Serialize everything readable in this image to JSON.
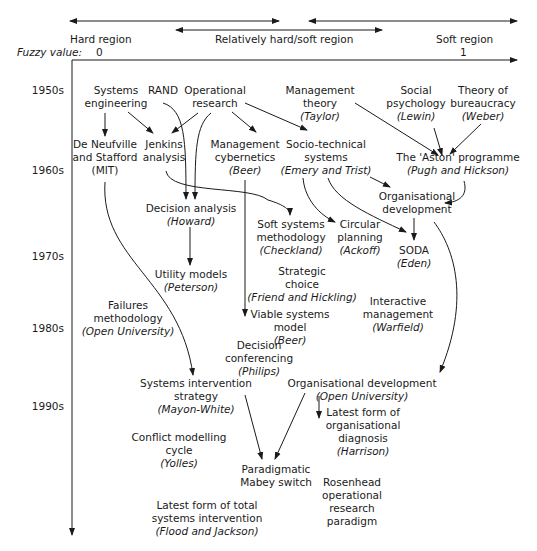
{
  "header": {
    "hard_region": "Hard region",
    "relative_region": "Relatively hard/soft region",
    "soft_region": "Soft region",
    "fuzzy_label": "Fuzzy value:",
    "fuzzy_min": "0",
    "fuzzy_max": "1"
  },
  "decades": [
    "1950s",
    "1960s",
    "1970s",
    "1980s",
    "1990s"
  ],
  "nodes": {
    "systems_engineering": {
      "l1": "Systems",
      "l2": "engineering"
    },
    "rand": {
      "l1": "RAND"
    },
    "operational_research": {
      "l1": "Operational",
      "l2": "research"
    },
    "management_theory": {
      "l1": "Management",
      "l2": "theory",
      "author": "(Taylor)"
    },
    "social_psychology": {
      "l1": "Social",
      "l2": "psychology",
      "author": "(Lewin)"
    },
    "theory_bureaucracy": {
      "l1": "Theory of",
      "l2": "bureaucracy",
      "author": "(Weber)"
    },
    "de_neufville": {
      "l1": "De Neufville",
      "l2": "and Stafford",
      "l3": "(MIT)"
    },
    "jenkins": {
      "l1": "Jenkins",
      "l2": "analysis"
    },
    "mgmt_cybernetics": {
      "l1": "Management",
      "l2": "cybernetics",
      "author": "(Beer)"
    },
    "socio_technical": {
      "l1": "Socio-technical",
      "l2": "systems",
      "author": "(Emery and Trist)"
    },
    "aston": {
      "l1": "The 'Aston' programme",
      "author": "(Pugh and Hickson)"
    },
    "org_dev_1": {
      "l1": "Organisational",
      "l2": "development"
    },
    "decision_analysis": {
      "l1": "Decision analysis",
      "author": "(Howard)"
    },
    "soft_systems": {
      "l1": "Soft systems",
      "l2": "methodology",
      "author": "(Checkland)"
    },
    "circular_planning": {
      "l1": "Circular",
      "l2": "planning",
      "author": "(Ackoff)"
    },
    "soda": {
      "l1": "SODA",
      "author": "(Eden)"
    },
    "utility_models": {
      "l1": "Utility models",
      "author": "(Peterson)"
    },
    "strategic_choice": {
      "l1": "Strategic",
      "l2": "choice",
      "author": "(Friend and Hickling)"
    },
    "failures": {
      "l1": "Failures",
      "l2": "methodology",
      "author": "(Open University)"
    },
    "interactive_mgmt": {
      "l1": "Interactive",
      "l2": "management",
      "author": "(Warfield)"
    },
    "viable_systems": {
      "l1": "Viable systems",
      "l2": "model",
      "author": "(Beer)"
    },
    "decision_conf": {
      "l1": "Decision",
      "l2": "conferencing",
      "author": "(Philips)"
    },
    "systems_intervention": {
      "l1": "Systems intervention",
      "l2": "strategy",
      "author": "(Mayon-White)"
    },
    "org_dev_2": {
      "l1": "Organisational development",
      "author": "(Open University)"
    },
    "latest_org_diag": {
      "l1": "Latest form of",
      "l2": "organisational",
      "l3": "diagnosis",
      "author": "(Harrison)"
    },
    "conflict_modelling": {
      "l1": "Conflict modelling",
      "l2": "cycle",
      "author": "(Yolles)"
    },
    "paradigmatic": {
      "l1": "Paradigmatic",
      "l2": "Mabey switch"
    },
    "rosenhead": {
      "l1": "Rosenhead",
      "l2": "operational",
      "l3": "research",
      "l4": "paradigm"
    },
    "latest_total": {
      "l1": "Latest form of total",
      "l2": "systems intervention",
      "author": "(Flood and Jackson)"
    }
  }
}
